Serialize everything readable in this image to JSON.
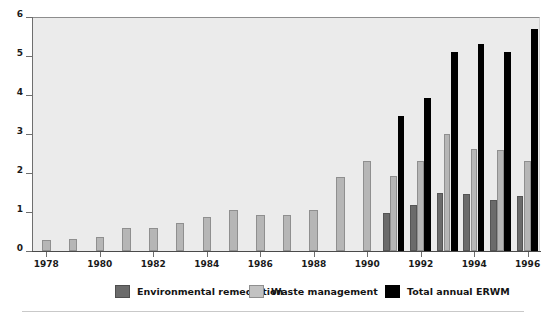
{
  "chart_data": {
    "type": "bar",
    "title": "",
    "subtitle": "",
    "xlabel": "",
    "ylabel": "",
    "xlim": [
      1977.4,
      1996.6
    ],
    "ylim": [
      0,
      6
    ],
    "yticks": [
      0,
      1,
      2,
      3,
      4,
      5,
      6
    ],
    "ytick_labels": [
      "0",
      "1",
      "2",
      "3",
      "4",
      "5",
      "6"
    ],
    "xticks": [
      1978,
      1980,
      1982,
      1984,
      1986,
      1988,
      1990,
      1992,
      1994,
      1996
    ],
    "xtick_labels": [
      "1978",
      "1980",
      "1982",
      "1984",
      "1986",
      "1988",
      "1990",
      "1992",
      "1994",
      "1996"
    ],
    "x": [
      1978,
      1979,
      1980,
      1981,
      1982,
      1983,
      1984,
      1985,
      1986,
      1987,
      1988,
      1989,
      1990,
      1991,
      1992,
      1993,
      1994,
      1995,
      1996
    ],
    "categories": [
      "1978",
      "1979",
      "1980",
      "1981",
      "1982",
      "1983",
      "1984",
      "1985",
      "1986",
      "1987",
      "1988",
      "1989",
      "1990",
      "1991",
      "1992",
      "1993",
      "1994",
      "1995",
      "1996"
    ],
    "grid": false,
    "legend_position": "bottom",
    "series": [
      {
        "name": "Environmental remediation",
        "color": "#6b6b6b",
        "values": [
          null,
          null,
          null,
          null,
          null,
          null,
          null,
          null,
          null,
          null,
          null,
          null,
          null,
          0.98,
          1.17,
          1.5,
          1.47,
          1.3,
          1.42
        ]
      },
      {
        "name": "Waste management",
        "color": "#b6b6b6",
        "values": [
          0.28,
          0.32,
          0.37,
          0.6,
          0.6,
          0.72,
          0.87,
          1.05,
          0.93,
          0.92,
          1.05,
          1.9,
          2.3,
          1.92,
          2.32,
          3.0,
          2.62,
          2.6,
          2.32
        ]
      },
      {
        "name": "Total annual ERWM",
        "color": "#000000",
        "values": [
          null,
          null,
          null,
          null,
          null,
          null,
          null,
          null,
          null,
          null,
          null,
          null,
          null,
          3.45,
          3.93,
          5.1,
          5.32,
          5.1,
          5.7
        ]
      }
    ]
  },
  "legend": {
    "items": [
      {
        "label": "Environmental remediation",
        "swatch": "rem"
      },
      {
        "label": "Waste management",
        "swatch": "wst"
      },
      {
        "label": "Total annual ERWM",
        "swatch": "tot"
      }
    ]
  },
  "colors": {
    "remediation": "#6b6b6b",
    "waste": "#b6b6b6",
    "total": "#000000",
    "plot_background": "#ebebeb",
    "page_background": "#ffffff"
  }
}
